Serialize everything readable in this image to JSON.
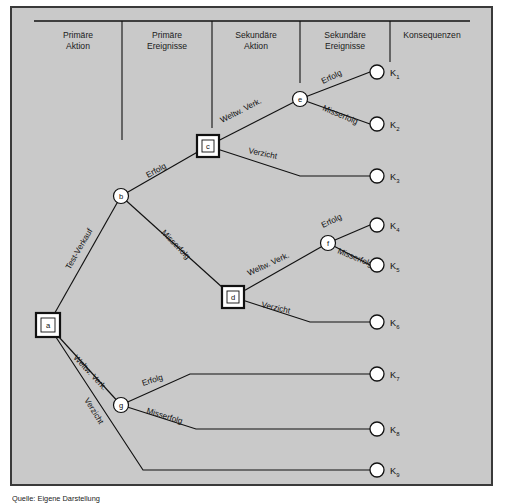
{
  "figure": {
    "background_color": "#c9c9c9",
    "border_color": "#3a3a3a",
    "line_color": "#111111",
    "caption": "Quelle: Eigene Darstellung"
  },
  "columns": [
    {
      "id": "col-primaere-aktion",
      "line1": "Primäre",
      "line2": "Aktion"
    },
    {
      "id": "col-primaere-ereignisse",
      "line1": "Primäre",
      "line2": "Ereignisse"
    },
    {
      "id": "col-sekundaere-aktion",
      "line1": "Sekundäre",
      "line2": "Aktion"
    },
    {
      "id": "col-sekundaere-ereignisse",
      "line1": "Sekundäre",
      "line2": "Ereignisse"
    },
    {
      "id": "col-konsequenzen",
      "line1": "Konsequenzen",
      "line2": ""
    }
  ],
  "nodes": [
    {
      "id": "a",
      "label": "a",
      "type": "decision",
      "x": 48,
      "y": 325
    },
    {
      "id": "b",
      "label": "b",
      "type": "chance",
      "x": 121,
      "y": 196
    },
    {
      "id": "c",
      "label": "c",
      "type": "decision",
      "x": 208,
      "y": 146
    },
    {
      "id": "d",
      "label": "d",
      "type": "decision",
      "x": 233,
      "y": 297
    },
    {
      "id": "e",
      "label": "e",
      "type": "chance",
      "x": 300,
      "y": 99
    },
    {
      "id": "f",
      "label": "f",
      "type": "chance",
      "x": 328,
      "y": 243
    },
    {
      "id": "g",
      "label": "g",
      "type": "chance",
      "x": 121,
      "y": 405
    }
  ],
  "terminals": [
    {
      "id": "K1",
      "letter": "K",
      "sub": "1",
      "x": 381,
      "y": 72
    },
    {
      "id": "K2",
      "letter": "K",
      "sub": "2",
      "x": 381,
      "y": 124
    },
    {
      "id": "K3",
      "letter": "K",
      "sub": "3",
      "x": 381,
      "y": 176
    },
    {
      "id": "K4",
      "letter": "K",
      "sub": "4",
      "x": 381,
      "y": 225
    },
    {
      "id": "K5",
      "letter": "K",
      "sub": "5",
      "x": 381,
      "y": 265
    },
    {
      "id": "K6",
      "letter": "K",
      "sub": "6",
      "x": 381,
      "y": 322
    },
    {
      "id": "K7",
      "letter": "K",
      "sub": "7",
      "x": 381,
      "y": 374
    },
    {
      "id": "K8",
      "letter": "K",
      "sub": "8",
      "x": 381,
      "y": 429
    },
    {
      "id": "K9",
      "letter": "K",
      "sub": "9",
      "x": 381,
      "y": 470
    }
  ],
  "edges": [
    {
      "id": "a-b",
      "from": "a",
      "to": "b",
      "label": "Test-Verkauf",
      "label_x": 70,
      "label_y": 270,
      "rotate": -60
    },
    {
      "id": "a-g",
      "from": "a",
      "to": "g",
      "label": "Weltw. Verk.",
      "label_x": 73,
      "label_y": 358,
      "rotate": 47
    },
    {
      "id": "a-K9",
      "from": "a",
      "to": "K9",
      "label": "Verzicht",
      "label_x": 84,
      "label_y": 400,
      "rotate": 58
    },
    {
      "id": "b-c",
      "from": "b",
      "to": "c",
      "label": "Erfolg",
      "label_x": 148,
      "label_y": 178,
      "rotate": -29
    },
    {
      "id": "b-d",
      "from": "b",
      "to": "d",
      "label": "Misserfolg",
      "label_x": 161,
      "label_y": 233,
      "rotate": 46
    },
    {
      "id": "c-e",
      "from": "c",
      "to": "e",
      "label": "Weltw. Verk.",
      "label_x": 222,
      "label_y": 123,
      "rotate": -27
    },
    {
      "id": "c-K3",
      "from": "c",
      "to": "K3",
      "label": "Verzicht",
      "label_x": 248,
      "label_y": 153,
      "rotate": 12
    },
    {
      "id": "e-K1",
      "from": "e",
      "to": "K1",
      "label": "Erfolg",
      "label_x": 323,
      "label_y": 84,
      "rotate": -26
    },
    {
      "id": "e-K2",
      "from": "e",
      "to": "K2",
      "label": "Misserfolg",
      "label_x": 322,
      "label_y": 110,
      "rotate": 23
    },
    {
      "id": "d-f",
      "from": "d",
      "to": "f",
      "label": "Weltw. Verk.",
      "label_x": 249,
      "label_y": 276,
      "rotate": -25
    },
    {
      "id": "d-K6",
      "from": "d",
      "to": "K6",
      "label": "Verzicht",
      "label_x": 261,
      "label_y": 307,
      "rotate": 13
    },
    {
      "id": "f-K4",
      "from": "f",
      "to": "K4",
      "label": "Erfolg",
      "label_x": 323,
      "label_y": 228,
      "rotate": -26
    },
    {
      "id": "f-K5",
      "from": "f",
      "to": "K5",
      "label": "Misserfolg",
      "label_x": 337,
      "label_y": 253,
      "rotate": 22
    },
    {
      "id": "g-K7",
      "from": "g",
      "to": "K7",
      "label": "Erfolg",
      "label_x": 143,
      "label_y": 386,
      "rotate": -18
    },
    {
      "id": "g-K8",
      "from": "g",
      "to": "K8",
      "label": "Misserfolg",
      "label_x": 146,
      "label_y": 413,
      "rotate": 17
    }
  ]
}
